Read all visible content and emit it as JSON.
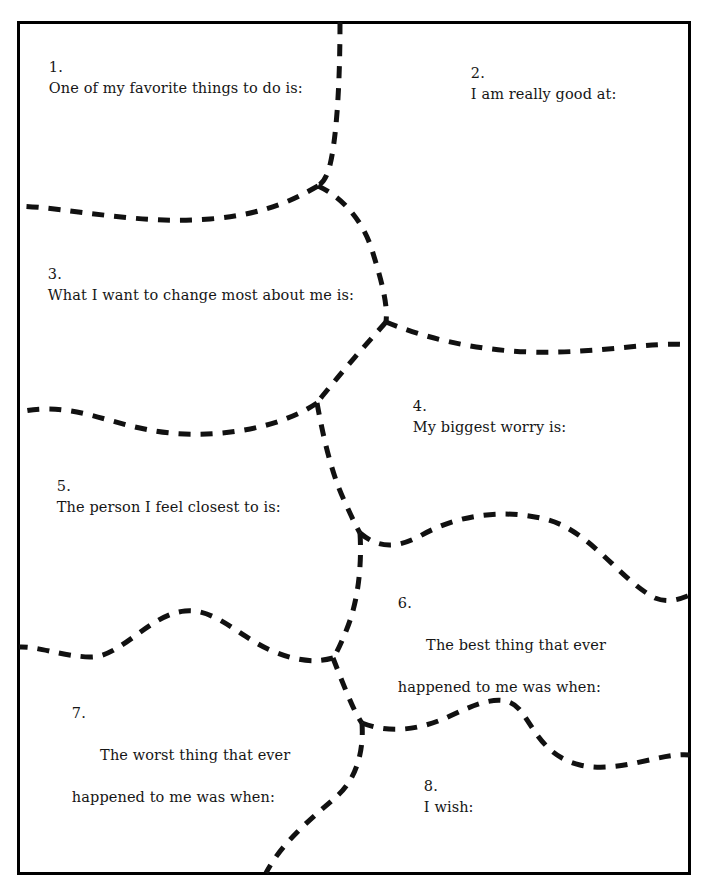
{
  "worksheet": {
    "title": "Puzzle piece sentence-completion worksheet",
    "border_color": "#000000",
    "line_color": "#111111",
    "background_color": "#ffffff",
    "prompts": [
      {
        "number": "1.",
        "line1": "One of my favorite things to do is:",
        "line2": ""
      },
      {
        "number": "2.",
        "line1": "I am really good at:",
        "line2": ""
      },
      {
        "number": "3.",
        "line1": "What I want to change most about me is:",
        "line2": ""
      },
      {
        "number": "4.",
        "line1": "My biggest worry is:",
        "line2": ""
      },
      {
        "number": "5.",
        "line1": "The person I feel closest to is:",
        "line2": ""
      },
      {
        "number": "6.",
        "line1": "The best thing that ever",
        "line2": "happened to me was when:"
      },
      {
        "number": "7.",
        "line1": "The worst thing that ever",
        "line2": "happened to me was when:"
      },
      {
        "number": "8.",
        "line1": "I wish:",
        "line2": ""
      }
    ]
  }
}
